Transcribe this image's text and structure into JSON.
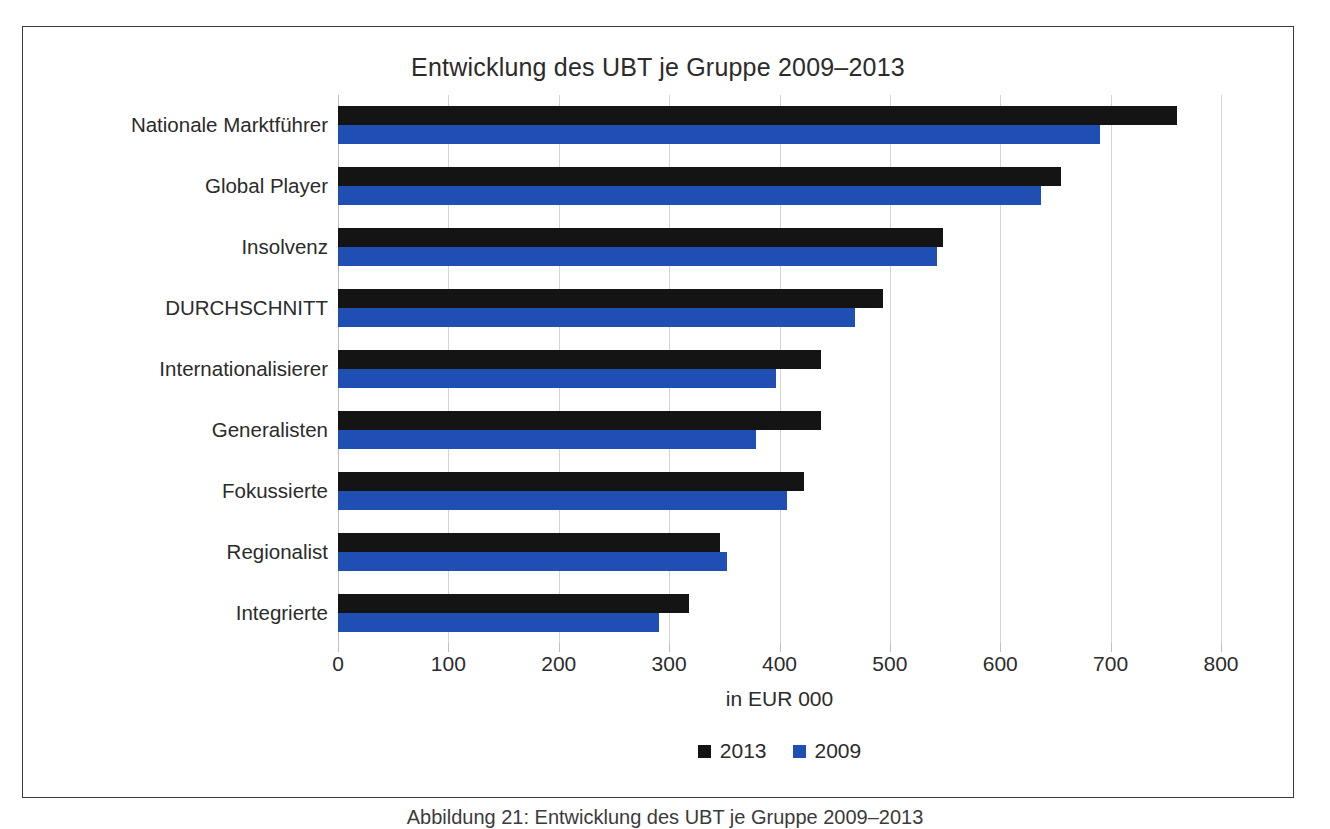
{
  "chart_data": {
    "type": "bar",
    "orientation": "horizontal",
    "title": "Entwicklung des UBT je Gruppe 2009–2013",
    "xlabel": "in EUR 000",
    "ylabel": "",
    "xlim": [
      0,
      800
    ],
    "xticks": [
      0,
      100,
      200,
      300,
      400,
      500,
      600,
      700,
      800
    ],
    "grid": "vertical",
    "legend_position": "bottom-center",
    "categories": [
      "Nationale Marktführer",
      "Global Player",
      "Insolvenz",
      "DURCHSCHNITT",
      "Internationalisierer",
      "Generalisten",
      "Fokussierte",
      "Regionalist",
      "Integrierte"
    ],
    "series": [
      {
        "name": "2013",
        "color": "#141414",
        "values": [
          760,
          655,
          548,
          494,
          438,
          438,
          422,
          346,
          318
        ]
      },
      {
        "name": "2009",
        "color": "#1f4fb2",
        "values": [
          690,
          637,
          543,
          468,
          397,
          379,
          407,
          352,
          291
        ]
      }
    ]
  },
  "legend": [
    {
      "label": "2013",
      "color": "#141414"
    },
    {
      "label": "2009",
      "color": "#1f4fb2"
    }
  ],
  "caption": "Abbildung 21: Entwicklung des UBT je Gruppe 2009–2013"
}
